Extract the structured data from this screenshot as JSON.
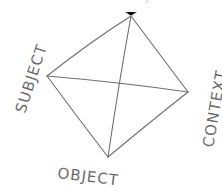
{
  "diagram": {
    "type": "hand-drawn diamond with diagonals",
    "stroke_color": "#6e6e6e",
    "vertices": {
      "top": [
        131,
        16
      ],
      "left": [
        47,
        76
      ],
      "right": [
        188,
        92
      ],
      "bottom": [
        108,
        157
      ]
    },
    "labels": {
      "subject": "SUBJECT",
      "object": "OBJECT",
      "context": "CONTEXT"
    }
  }
}
